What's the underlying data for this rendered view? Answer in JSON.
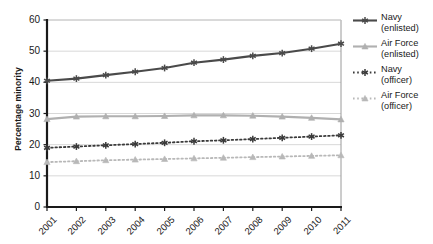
{
  "chart_data": {
    "type": "line",
    "title": "",
    "xlabel": "",
    "ylabel": "Percentage minority",
    "x": [
      "2001",
      "2002",
      "2003",
      "2004",
      "2005",
      "2006",
      "2007",
      "2008",
      "2009",
      "2010",
      "2011"
    ],
    "xlim": [
      2001,
      2011
    ],
    "ylim": [
      0,
      60
    ],
    "yticks": [
      0,
      10,
      20,
      30,
      40,
      50,
      60
    ],
    "grid": "horizontal",
    "legend_position": "right",
    "series": [
      {
        "name": "Navy (enlisted)",
        "label_line1": "Navy",
        "label_line2": "(enlisted)",
        "color": "#4a4a4a",
        "style": "solid",
        "marker": "asterisk",
        "values": [
          40.5,
          41.2,
          42.3,
          43.4,
          44.6,
          46.3,
          47.3,
          48.5,
          49.4,
          50.8,
          52.4
        ]
      },
      {
        "name": "Air Force (enlisted)",
        "label_line1": "Air Force",
        "label_line2": "(enlisted)",
        "color": "#b0b0b0",
        "style": "solid",
        "marker": "triangle",
        "values": [
          28.2,
          29.0,
          29.1,
          29.1,
          29.2,
          29.4,
          29.4,
          29.3,
          29.0,
          28.6,
          28.1
        ]
      },
      {
        "name": "Navy (officer)",
        "label_line1": "Navy",
        "label_line2": "(officer)",
        "color": "#3a3a3a",
        "style": "dotted",
        "marker": "asterisk",
        "values": [
          19.0,
          19.4,
          19.8,
          20.2,
          20.6,
          21.1,
          21.4,
          21.8,
          22.2,
          22.6,
          23.0
        ]
      },
      {
        "name": "Air Force (officer)",
        "label_line1": "Air Force",
        "label_line2": "(officer)",
        "color": "#b8b8b8",
        "style": "dotted",
        "marker": "triangle",
        "values": [
          14.4,
          14.7,
          15.0,
          15.2,
          15.4,
          15.6,
          15.8,
          16.0,
          16.2,
          16.4,
          16.6
        ]
      }
    ]
  },
  "axis": {
    "y_title": "Percentage minority"
  },
  "colors": {
    "navy": "#4a4a4a",
    "air_force": "#b0b0b0",
    "axis": "#1a1a1a",
    "grid": "#d8d8d8"
  }
}
